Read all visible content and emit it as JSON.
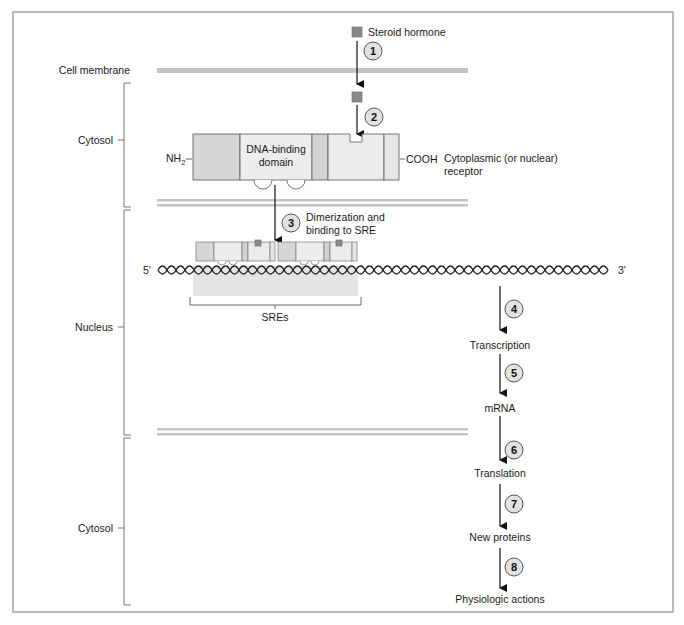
{
  "colors": {
    "frame": "#8c8c8c",
    "membrane": "#c4c4c4",
    "receptor_fill": "#ececec",
    "receptor_dark": "#d2d2d2",
    "hormone": "#8a8a8a",
    "step_circle": "#e2e2e2",
    "sre_region": "#e4e4e4",
    "arrow": "#111111"
  },
  "compartments": {
    "cell_membrane": "Cell membrane",
    "cytosol_top": "Cytosol",
    "nucleus": "Nucleus",
    "cytosol_bottom": "Cytosol"
  },
  "hormone": {
    "label": "Steroid hormone"
  },
  "receptor": {
    "n_terminus": "NH",
    "n_terminus_sub": "2",
    "dna_binding_line1": "DNA-binding",
    "dna_binding_line2": "domain",
    "c_terminus": "COOH",
    "description_line1": "Cytoplasmic (or nuclear)",
    "description_line2": "receptor"
  },
  "dna": {
    "five_prime": "5'",
    "three_prime": "3'",
    "sre_label": "SREs"
  },
  "steps": [
    {
      "number": "1",
      "label": ""
    },
    {
      "number": "2",
      "label": ""
    },
    {
      "number": "3",
      "label_line1": "Dimerization and",
      "label_line2": "binding to SRE"
    },
    {
      "number": "4",
      "label": "Transcription"
    },
    {
      "number": "5",
      "label": "mRNA"
    },
    {
      "number": "6",
      "label": "Translation"
    },
    {
      "number": "7",
      "label": "New proteins"
    },
    {
      "number": "8",
      "label": "Physiologic actions"
    }
  ]
}
